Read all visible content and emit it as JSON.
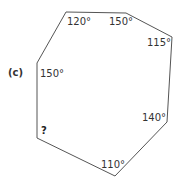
{
  "diagram": {
    "part_label": "(c)",
    "shape": "heptagon",
    "stroke_color": "#555555",
    "vertices": [
      {
        "x": 66,
        "y": 12
      },
      {
        "x": 126,
        "y": 13
      },
      {
        "x": 172,
        "y": 37
      },
      {
        "x": 167,
        "y": 122
      },
      {
        "x": 115,
        "y": 176
      },
      {
        "x": 37,
        "y": 138
      },
      {
        "x": 37,
        "y": 63
      }
    ],
    "angles": [
      {
        "label": "120°",
        "x": 67,
        "y": 25
      },
      {
        "label": "150°",
        "x": 109,
        "y": 25
      },
      {
        "label": "115°",
        "x": 147,
        "y": 46
      },
      {
        "label": "140°",
        "x": 142,
        "y": 121
      },
      {
        "label": "110°",
        "x": 101,
        "y": 168
      },
      {
        "label": "?",
        "x": 41,
        "y": 134
      },
      {
        "label": "150°",
        "x": 40,
        "y": 77
      }
    ]
  }
}
